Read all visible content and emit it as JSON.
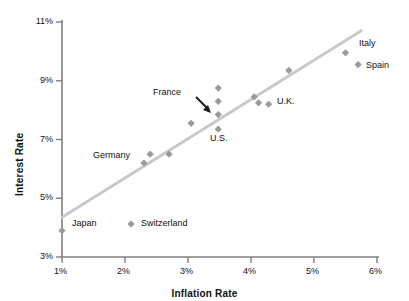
{
  "chart_data": {
    "type": "scatter",
    "title": "",
    "xlabel": "Inflation Rate",
    "ylabel": "Interest Rate",
    "xlim": [
      1,
      6
    ],
    "ylim": [
      3,
      11
    ],
    "xticks": [
      "1%",
      "2%",
      "3%",
      "4%",
      "5%",
      "6%"
    ],
    "xtick_values": [
      1,
      2,
      3,
      4,
      5,
      6
    ],
    "yticks": [
      "3%",
      "5%",
      "7%",
      "9%",
      "11%"
    ],
    "ytick_values": [
      3,
      5,
      7,
      9,
      11
    ],
    "grid": false,
    "legend": "none",
    "marker_shape": "diamond",
    "marker_color": "#9a9a9a",
    "trendline": {
      "label": "",
      "color": "#c9c9c9",
      "x_start": 1.0,
      "y_start": 4.35,
      "x_end": 5.75,
      "y_end": 10.7
    },
    "points": [
      {
        "name": "Japan",
        "x": 1.0,
        "y": 3.9
      },
      {
        "name": "Germany",
        "x": 2.3,
        "y": 6.2
      },
      {
        "name": "",
        "x": 2.4,
        "y": 6.5
      },
      {
        "name": "",
        "x": 2.7,
        "y": 6.5
      },
      {
        "name": "",
        "x": 3.05,
        "y": 7.55
      },
      {
        "name": "",
        "x": 3.48,
        "y": 8.75
      },
      {
        "name": "",
        "x": 3.48,
        "y": 8.3
      },
      {
        "name": "France",
        "x": 3.48,
        "y": 7.85
      },
      {
        "name": "U.S.",
        "x": 3.48,
        "y": 7.35
      },
      {
        "name": "",
        "x": 4.05,
        "y": 8.45
      },
      {
        "name": "",
        "x": 4.12,
        "y": 8.25
      },
      {
        "name": "U.K.",
        "x": 4.28,
        "y": 8.2
      },
      {
        "name": "",
        "x": 4.6,
        "y": 9.35
      },
      {
        "name": "Italy",
        "x": 5.5,
        "y": 9.95
      },
      {
        "name": "Spain",
        "x": 5.7,
        "y": 9.55
      }
    ],
    "annotations": [
      {
        "name": "Japan",
        "text": "Japan"
      },
      {
        "name": "Switzerland",
        "text": "Switzerland"
      },
      {
        "name": "Germany",
        "text": "Germany"
      },
      {
        "name": "France",
        "text": "France"
      },
      {
        "name": "U.S.",
        "text": "U.S."
      },
      {
        "name": "U.K.",
        "text": "U.K."
      },
      {
        "name": "Italy",
        "text": "Italy"
      },
      {
        "name": "Spain",
        "text": "Spain"
      }
    ]
  },
  "axes": {
    "x_title": "Inflation Rate",
    "y_title": "Interest Rate",
    "x_tick_labels": [
      "1%",
      "2%",
      "3%",
      "4%",
      "5%",
      "6%"
    ],
    "y_tick_labels": [
      "11%",
      "9%",
      "7%",
      "5%",
      "3%"
    ]
  },
  "labels": {
    "japan": "Japan",
    "switzerland": "Switzerland",
    "germany": "Germany",
    "france": "France",
    "us": "U.S.",
    "uk": "U.K.",
    "italy": "Italy",
    "spain": "Spain"
  },
  "colors": {
    "marker": "#9a9a9a",
    "trendline": "#c9c9c9",
    "axis": "#808080",
    "text": "#111111",
    "arrow": "#1a1a1a",
    "background": "#ffffff"
  }
}
